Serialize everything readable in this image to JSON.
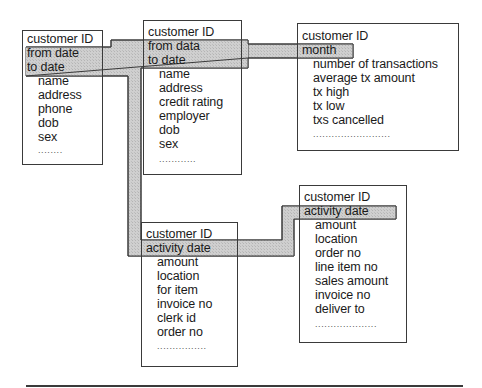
{
  "diagram": {
    "type": "entity-relationship",
    "entities": [
      {
        "id": "customer-1",
        "keys": [
          "customer ID",
          "from date",
          "to date"
        ],
        "highlighted_keys": [
          "from date",
          "to date"
        ],
        "attributes": [
          "name",
          "address",
          "phone",
          "dob",
          "sex"
        ],
        "ellipsis": "........"
      },
      {
        "id": "customer-2",
        "keys": [
          "customer ID",
          "from data",
          "to date"
        ],
        "highlighted_keys": [
          "from data",
          "to date"
        ],
        "attributes": [
          "name",
          "address",
          "credit rating",
          "employer",
          "dob",
          "sex"
        ],
        "ellipsis": "............"
      },
      {
        "id": "monthly-summary",
        "keys": [
          "customer ID",
          "month"
        ],
        "highlighted_keys": [
          "month"
        ],
        "attributes": [
          "number of transactions",
          "average tx amount",
          "tx high",
          "tx low",
          "txs cancelled"
        ],
        "ellipsis": "........................."
      },
      {
        "id": "transaction",
        "keys": [
          "customer ID",
          "activity date"
        ],
        "highlighted_keys": [
          "activity date"
        ],
        "attributes": [
          "amount",
          "location",
          "for item",
          "invoice no",
          "clerk id",
          "order no"
        ],
        "ellipsis": "................"
      },
      {
        "id": "sales-order",
        "keys": [
          "customer ID",
          "activity date"
        ],
        "highlighted_keys": [
          "activity date"
        ],
        "attributes": [
          "amount",
          "location",
          "order no",
          "line item no",
          "sales amount",
          "invoice no",
          "deliver to"
        ],
        "ellipsis": "...................."
      }
    ],
    "links": [
      {
        "from": "customer-1.from date/to date",
        "to": "customer-2.from data/to date"
      },
      {
        "from": "customer-2.from data/to date",
        "to": "monthly-summary.month"
      },
      {
        "from": "customer-1.from date/to date",
        "to": "transaction.activity date"
      },
      {
        "from": "transaction.activity date",
        "to": "sales-order.activity date"
      }
    ],
    "colors": {
      "connector_fill": "#c8c8c8",
      "connector_stroke": "#3a3a3a",
      "box_border": "#3a3a3a",
      "text": "#1a1a1a",
      "background": "#ffffff"
    }
  }
}
